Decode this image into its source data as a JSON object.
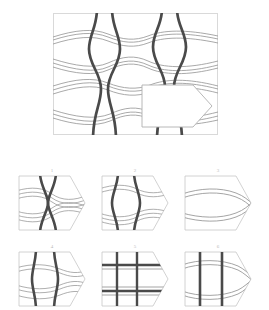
{
  "puzzle": {
    "type": "visual-pattern-completion",
    "title_text": "",
    "description": "Raven's-style matrix: a woven lattice pattern with a pentagon-shaped piece removed; six candidate pieces below.",
    "main_panel": {
      "name": "pattern-panel",
      "border_color": "#d9d9d9",
      "background": "#ffffff",
      "thick_line_color": "#4a4a4a",
      "thin_line_color": "#9a9a9a",
      "missing_piece": {
        "name": "missing-piece-cutout",
        "shape": "pentagon-arrow-right",
        "fill": "#ffffff",
        "stroke": "#b0b0b0"
      },
      "pattern": {
        "vertical_pairs": 2,
        "horizontal_bands": 4,
        "weave": "pinched-hourglass"
      }
    },
    "options": [
      {
        "number": "1",
        "name": "option-1",
        "pattern": "pinched-hourglass-verticals-with-wavy-horizontals",
        "verticals": "crossing",
        "horizontals": "wavy"
      },
      {
        "number": "2",
        "name": "option-2",
        "pattern": "bulging-verticals-with-wavy-horizontals",
        "verticals": "bulging-apart",
        "horizontals": "wavy"
      },
      {
        "number": "3",
        "name": "option-3",
        "pattern": "horizontals-only-no-verticals",
        "verticals": "none",
        "horizontals": "wavy"
      },
      {
        "number": "4",
        "name": "option-4",
        "pattern": "slightly-bowed-verticals-with-wavy-horizontals",
        "verticals": "bowed",
        "horizontals": "wavy"
      },
      {
        "number": "5",
        "name": "option-5",
        "pattern": "straight-grid-verticals-and-horizontals",
        "verticals": "straight",
        "horizontals": "straight"
      },
      {
        "number": "6",
        "name": "option-6",
        "pattern": "straight-verticals-with-lens-oval-horizontals",
        "verticals": "straight",
        "horizontals": "lens-oval"
      }
    ],
    "colors": {
      "thick_line": "#4a4a4a",
      "thin_line": "#9a9a9a",
      "panel_border": "#d9d9d9",
      "option_border": "#c6c6c6",
      "label_text": "#b9b9b9",
      "page_background": "#ffffff"
    }
  }
}
